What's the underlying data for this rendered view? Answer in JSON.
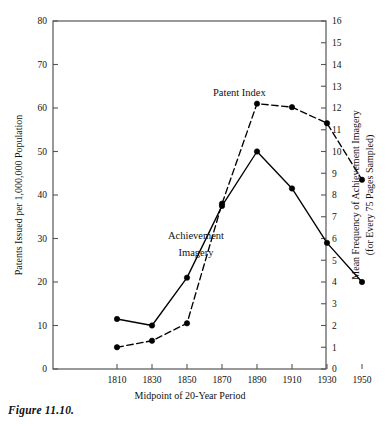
{
  "figure": {
    "caption": "Figure 11.10."
  },
  "chart_data": {
    "type": "line",
    "title": "",
    "xlabel": "Midpoint of 20-Year Period",
    "ylabel": "Patents Issued per 1,000,000 Population",
    "y2label_line1": "Mean Frequency of Achievement Imagery",
    "y2label_line2": "(for Every 75 Pages Sampled)",
    "categories": [
      1810,
      1830,
      1850,
      1870,
      1890,
      1910,
      1930,
      1950
    ],
    "x_tick_labels": [
      "1810",
      "1830",
      "1850",
      "1870",
      "1890",
      "1910",
      "1930",
      "1950"
    ],
    "xlim": [
      1800,
      1960
    ],
    "ylim": [
      0,
      80
    ],
    "y_ticks": [
      0,
      10,
      20,
      30,
      40,
      50,
      60,
      70,
      80
    ],
    "y_tick_labels": [
      "0",
      "10",
      "20",
      "30",
      "40",
      "50",
      "60",
      "70",
      "80"
    ],
    "y2lim": [
      0,
      16
    ],
    "y2_ticks": [
      0,
      1,
      2,
      3,
      4,
      5,
      6,
      7,
      8,
      9,
      10,
      11,
      12,
      13,
      14,
      15,
      16
    ],
    "y2_tick_labels": [
      "0",
      "1",
      "2",
      "3",
      "4",
      "5",
      "6",
      "7",
      "8",
      "9",
      "10",
      "11",
      "12",
      "13",
      "14",
      "15",
      "16"
    ],
    "grid": false,
    "legend_position": "inline-annotations",
    "series": [
      {
        "name": "Patent Index",
        "axis": "left",
        "style": "dashed",
        "marker": "filled-circle",
        "values": [
          5.0,
          6.5,
          10.5,
          38.0,
          61.0,
          60.2,
          56.5,
          43.5
        ],
        "annotation": "Patent Index"
      },
      {
        "name": "Achievement Imagery",
        "axis": "right",
        "style": "solid",
        "marker": "filled-circle",
        "values": [
          2.3,
          2.0,
          4.2,
          7.5,
          10.0,
          8.3,
          5.8,
          4.0
        ],
        "annotation_line1": "Achievement",
        "annotation_line2": "Imagery"
      }
    ],
    "colors": {
      "line": "#000000",
      "axis": "#555555",
      "text": "#111111",
      "background": "#ffffff"
    }
  }
}
